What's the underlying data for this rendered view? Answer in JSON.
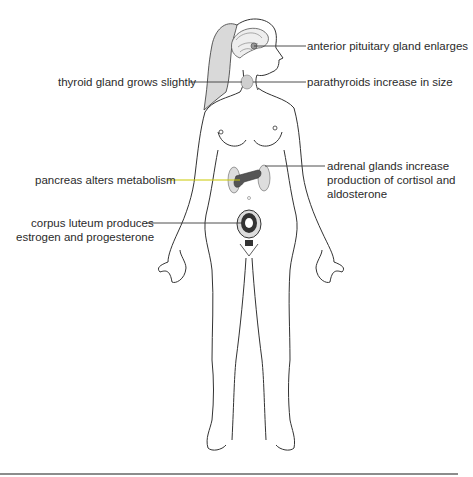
{
  "figure": {
    "colors": {
      "outline": "#333333",
      "leader": "#3a3a3a",
      "pancreas_leader": "#c9c800",
      "hair": "#d9d9d9",
      "gland_fill": "#cfcfcf",
      "pancreas_fill": "#555555",
      "rule": "#666666",
      "text": "#2b2b2b"
    },
    "labels": {
      "pituitary": "anterior pituitary gland enlarges",
      "thyroid": "thyroid gland grows slightly",
      "parathyroids": "parathyroids increase in size",
      "pancreas": "pancreas alters metabolism",
      "adrenal_line1": "adrenal glands increase",
      "adrenal_line2": "production of cortisol and",
      "adrenal_line3": "aldosterone",
      "corpus_line1": "corpus luteum produces",
      "corpus_line2": "estrogen and progesterone"
    }
  }
}
